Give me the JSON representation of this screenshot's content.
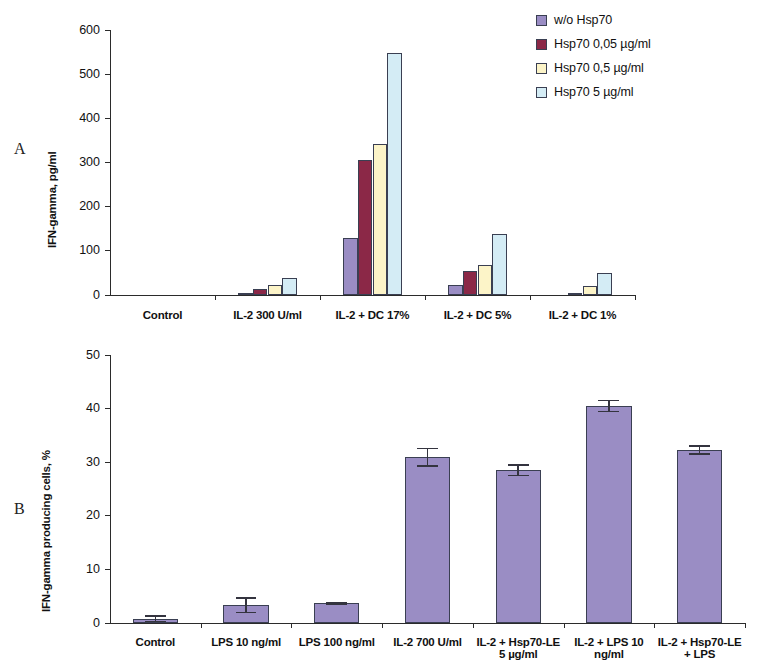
{
  "figure": {
    "panel_a_letter": "A",
    "panel_b_letter": "B"
  },
  "legend": {
    "items": [
      {
        "label": "w/o Hsp70",
        "color": "#9a8dc4"
      },
      {
        "label": "Hsp70 0,05 µg/ml",
        "color": "#8b2847"
      },
      {
        "label": "Hsp70 0,5 µg/ml",
        "color": "#fcf4c8"
      },
      {
        "label": "Hsp70 5 µg/ml",
        "color": "#d4ecf5"
      }
    ]
  },
  "chart_data": [
    {
      "type": "bar",
      "panel": "A",
      "title": "",
      "xlabel": "",
      "ylabel": "IFN-gamma, pg/ml",
      "ylim": [
        0,
        600
      ],
      "yticks": [
        0,
        100,
        200,
        300,
        400,
        500,
        600
      ],
      "ytick_labels": [
        "0",
        "100",
        "200",
        "300",
        "400",
        "500",
        "600"
      ],
      "grid": false,
      "legend_position": "top-right",
      "categories": [
        "Control",
        "IL-2 300 U/ml",
        "IL-2 + DC 17%",
        "IL-2 + DC 5%",
        "IL-2 + DC 1%"
      ],
      "series": [
        {
          "name": "w/o Hsp70",
          "color": "#9a8dc4",
          "values": [
            0,
            2,
            130,
            22,
            0
          ]
        },
        {
          "name": "Hsp70 0,05 µg/ml",
          "color": "#8b2847",
          "values": [
            0,
            13,
            305,
            55,
            4
          ]
        },
        {
          "name": "Hsp70 0,5 µg/ml",
          "color": "#fcf4c8",
          "values": [
            0,
            23,
            343,
            68,
            20
          ]
        },
        {
          "name": "Hsp70 5 µg/ml",
          "color": "#d4ecf5",
          "values": [
            0,
            38,
            548,
            138,
            50
          ]
        }
      ]
    },
    {
      "type": "bar",
      "panel": "B",
      "title": "",
      "xlabel": "",
      "ylabel": "IFN-gamma producing cells, %",
      "ylim": [
        0,
        50
      ],
      "yticks": [
        0,
        10,
        20,
        30,
        40,
        50
      ],
      "ytick_labels": [
        "0",
        "10",
        "20",
        "30",
        "40",
        "50"
      ],
      "grid": false,
      "legend_position": "none",
      "bar_color": "#9a8dc4",
      "categories": [
        "Control",
        "LPS 10 ng/ml",
        "LPS 100 ng/ml",
        "IL-2 700 U/ml",
        "IL-2 + Hsp70-LE 5 µg/ml",
        "IL-2 + LPS 10 ng/ml",
        "IL-2 + Hsp70-LE + LPS"
      ],
      "values": [
        0.8,
        3.3,
        3.7,
        30.9,
        28.5,
        40.5,
        32.3
      ],
      "errors": [
        0.7,
        1.5,
        0.3,
        1.8,
        1.1,
        1.2,
        0.9
      ]
    }
  ]
}
